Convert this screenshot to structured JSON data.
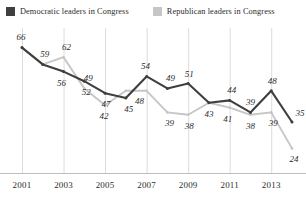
{
  "legend": {
    "entries": [
      {
        "label": "Democratic leaders in Congress",
        "color": "#3f3f3f",
        "icon": "square-swatch"
      },
      {
        "label": "Republican leaders in Congress",
        "color": "#c6c6c6",
        "icon": "square-swatch"
      }
    ]
  },
  "axis": {
    "ticks": [
      "2001",
      "2003",
      "2005",
      "2007",
      "2009",
      "2011",
      "2013"
    ]
  },
  "chart_data": {
    "type": "line",
    "title": "",
    "subtitle": "",
    "xlabel": "",
    "ylabel": "",
    "grid": "vertical-only",
    "legend_position": "top",
    "x": [
      2001,
      2002,
      2003,
      2004,
      2005,
      2006,
      2007,
      2008,
      2009,
      2010,
      2011,
      2012,
      2013,
      2014
    ],
    "xlim": [
      2001,
      2014
    ],
    "ylim": [
      20,
      70
    ],
    "xticks": [
      2001,
      2003,
      2005,
      2007,
      2009,
      2011,
      2013
    ],
    "series": [
      {
        "name": "Democratic leaders in Congress",
        "color": "#3f3f3f",
        "values": [
          66,
          59,
          56,
          52,
          47,
          45,
          54,
          49,
          51,
          43,
          44,
          39,
          48,
          35
        ],
        "labels": [
          "66",
          "59",
          "56",
          "52",
          "47",
          "45",
          "54",
          "49",
          "51",
          "43",
          "44",
          "39",
          "48",
          "35"
        ]
      },
      {
        "name": "Republican leaders in Congress",
        "color": "#c6c6c6",
        "values": [
          66,
          59,
          62,
          49,
          42,
          48,
          48,
          39,
          38,
          43,
          41,
          38,
          39,
          24
        ],
        "labels": [
          "",
          "",
          "62",
          "49",
          "42",
          "",
          "48",
          "39",
          "38",
          "",
          "41",
          "38",
          "39",
          "24"
        ]
      }
    ],
    "annotations": []
  }
}
